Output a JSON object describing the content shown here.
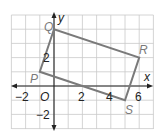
{
  "figure": {
    "axes": {
      "x_label": "x",
      "y_label": "y",
      "origin_label": "O",
      "x_range": [
        -3,
        7
      ],
      "y_range": [
        -3,
        5
      ],
      "x_ticks": [
        {
          "value": -2,
          "label": "−2"
        },
        {
          "value": 2,
          "label": "2"
        },
        {
          "value": 4,
          "label": "4"
        },
        {
          "value": 6,
          "label": "6"
        }
      ],
      "y_ticks": [
        {
          "value": 2,
          "label": "2"
        },
        {
          "value": -2,
          "label": "−2"
        }
      ]
    },
    "quadrilateral": {
      "vertices": [
        {
          "label": "P",
          "x": -1,
          "y": 1
        },
        {
          "label": "Q",
          "x": 0,
          "y": 4
        },
        {
          "label": "R",
          "x": 6,
          "y": 2
        },
        {
          "label": "S",
          "x": 5,
          "y": -1
        }
      ],
      "stroke_color": "#7a7a7a"
    },
    "colors": {
      "grid": "#c9c9c9",
      "axes": "#222222",
      "shape": "#7a7a7a"
    }
  }
}
